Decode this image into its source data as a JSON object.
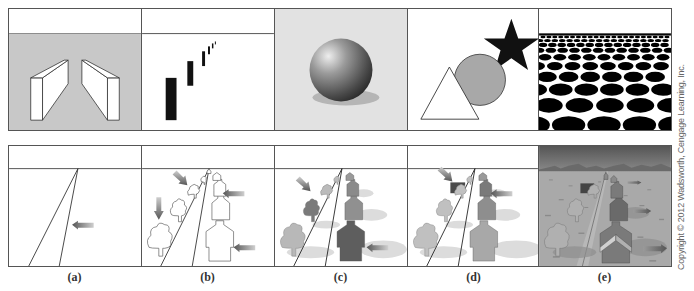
{
  "figure": {
    "panels_top": [
      {
        "id": "top-a",
        "content": "two-slanted-blocks",
        "background": "#c8c8c8"
      },
      {
        "id": "top-b",
        "content": "receding-bars",
        "background": "#ffffff"
      },
      {
        "id": "top-c",
        "content": "shaded-sphere-with-shadow",
        "background": "#e2e2e2"
      },
      {
        "id": "top-d",
        "content": "triangle-circle-star-occlusion",
        "background": "#ffffff"
      },
      {
        "id": "top-e",
        "content": "texture-gradient-ellipses",
        "background": "#ffffff"
      }
    ],
    "panels_bottom": [
      {
        "id": "bottom-a",
        "content": "road-with-arrow"
      },
      {
        "id": "bottom-b",
        "content": "road-outline-trees-houses-arrows"
      },
      {
        "id": "bottom-c",
        "content": "road-shaded-trees-houses-arrows"
      },
      {
        "id": "bottom-d",
        "content": "road-shaded-occlusion-arrows"
      },
      {
        "id": "bottom-e",
        "content": "full-scene-mountains-field"
      }
    ],
    "labels": [
      "(a)",
      "(b)",
      "(c)",
      "(d)",
      "(e)"
    ],
    "copyright": "Copyright © 2012 Wadsworth, Cengage Learning, Inc.",
    "colors": {
      "border": "#555555",
      "panel_a_gray": "#c8c8c8",
      "sphere_bg": "#e2e2e2",
      "circle_fill": "#a8a8a8",
      "arrow": "#6a6a6a",
      "sky_e": "#6f6f6f",
      "field_e": "#a9a9a9"
    }
  }
}
